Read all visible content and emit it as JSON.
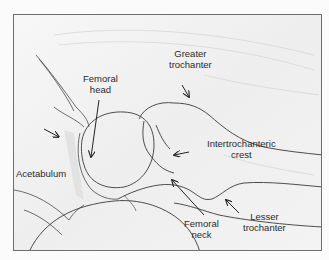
{
  "figure": {
    "colors": {
      "background": "#f4f4f4",
      "line": "#3a3a3a",
      "frame": "#6e6e6e",
      "shading": "#d8d8d8"
    },
    "labels": [
      {
        "id": "acetabulum",
        "lines": [
          "Acetabulum"
        ]
      },
      {
        "id": "femoral-head",
        "lines": [
          "Femoral",
          "head"
        ]
      },
      {
        "id": "greater-trochanter",
        "lines": [
          "Greater",
          "trochanter"
        ]
      },
      {
        "id": "intertrochanteric-crest",
        "lines": [
          "Intertrochanteric",
          "crest"
        ]
      },
      {
        "id": "femoral-neck",
        "lines": [
          "Femoral",
          "neck"
        ]
      },
      {
        "id": "lesser-trochanter",
        "lines": [
          "Lesser",
          "trochanter"
        ]
      }
    ]
  }
}
